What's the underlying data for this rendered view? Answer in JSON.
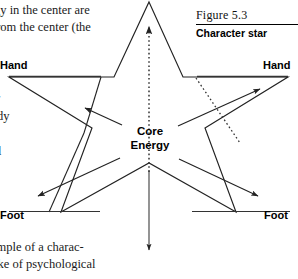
{
  "page": {
    "width": 298,
    "height": 279,
    "background": "#ffffff",
    "ink": "#1a1a1a"
  },
  "surrounding_text": {
    "top_line1": "gy in the center are",
    "top_line2": "from the center (the",
    "left_line1": "r",
    "left_line2": "dy",
    "left_line3": "l",
    "bottom_line1": "ample of a charac-",
    "bottom_line2": "ake of psychological"
  },
  "caption": {
    "number": "Figure 5.3",
    "title": "Character star"
  },
  "diagram": {
    "name": "character-star",
    "core_label_line1": "Core",
    "core_label_line2": "Energy",
    "points": [
      {
        "id": "hand-left",
        "label": "Hand"
      },
      {
        "id": "hand-right",
        "label": "Hand"
      },
      {
        "id": "foot-left",
        "label": "Foot"
      },
      {
        "id": "foot-right",
        "label": "Foot"
      }
    ],
    "arrows": [
      {
        "id": "arrow-up",
        "style": "dotted",
        "direction": "up",
        "from": "core",
        "to": "head-point"
      },
      {
        "id": "arrow-down",
        "style": "solid",
        "direction": "down",
        "from": "core",
        "to": "bottom-notch"
      },
      {
        "id": "arrow-up-left",
        "style": "solid",
        "direction": "up-left",
        "from": "core",
        "to": "hand-left"
      },
      {
        "id": "arrow-up-right",
        "style": "solid",
        "direction": "up-right",
        "from": "core",
        "to": "hand-right"
      },
      {
        "id": "arrow-down-left",
        "style": "solid",
        "direction": "down-left",
        "from": "core",
        "to": "foot-left"
      },
      {
        "id": "arrow-down-right",
        "style": "solid",
        "direction": "down-right",
        "from": "core",
        "to": "foot-right"
      },
      {
        "id": "arrow-diagonal-dotted-right",
        "style": "dotted",
        "direction": "down-right",
        "from": "hand-right-inner",
        "to": "foot-right-inner"
      }
    ],
    "stroke_color": "#222222"
  }
}
